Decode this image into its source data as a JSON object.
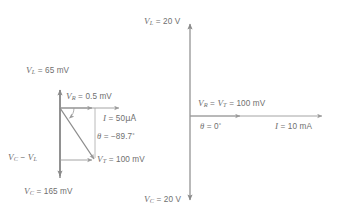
{
  "figure": {
    "type": "phasor-diagram-pair",
    "background_color": "#ffffff",
    "stroke_color": "#8a8a8a",
    "text_color": "#6f6f6f"
  },
  "left_diagram": {
    "name": "series-rlc-phasor-below-resonance",
    "labels": {
      "v_l": {
        "symbol": "V",
        "subscript": "L",
        "eq": "=",
        "value": "65 mV"
      },
      "v_r": {
        "symbol": "V",
        "subscript": "R",
        "eq": "=",
        "value": "0.5 mV"
      },
      "current": {
        "symbol": "I",
        "eq": "=",
        "value": "50",
        "unit": "μA"
      },
      "theta": {
        "symbol": "θ",
        "eq": "=",
        "value": "−89.7",
        "degree": "°"
      },
      "v_c_minus_v_l": {
        "symbol_a": "V",
        "sub_a": "C",
        "minus": "−",
        "symbol_b": "V",
        "sub_b": "L"
      },
      "v_t": {
        "symbol": "V",
        "subscript": "T",
        "eq": "=",
        "value": "100 mV"
      },
      "v_c": {
        "symbol": "V",
        "subscript": "C",
        "eq": "=",
        "value": "165 mV"
      }
    },
    "vectors": [
      {
        "name": "v-l-up",
        "from": [
          60,
          178
        ],
        "to": [
          60,
          88
        ],
        "direction": "up"
      },
      {
        "name": "v-c-down",
        "from": [
          60,
          88
        ],
        "to": [
          60,
          178
        ],
        "direction": "down"
      },
      {
        "name": "v-r-right",
        "from": [
          60,
          108
        ],
        "to": [
          95,
          108
        ],
        "direction": "right"
      },
      {
        "name": "i-right",
        "from": [
          60,
          108
        ],
        "to": [
          122,
          108
        ],
        "direction": "right"
      },
      {
        "name": "v-t-resultant",
        "from": [
          60,
          108
        ],
        "to": [
          95,
          160
        ],
        "direction": "down-right"
      },
      {
        "name": "v-c-minus-v-l",
        "from": [
          60,
          160
        ],
        "to": [
          95,
          160
        ],
        "direction": "right"
      },
      {
        "name": "v-c-minus-v-l-vertical",
        "from": [
          95,
          108
        ],
        "to": [
          95,
          160
        ],
        "direction": "down"
      }
    ],
    "angle_arc": {
      "center": [
        60,
        108
      ],
      "radius": 14,
      "label": "θ"
    }
  },
  "right_diagram": {
    "name": "series-rlc-phasor-at-resonance",
    "labels": {
      "v_l": {
        "symbol": "V",
        "subscript": "L",
        "eq": "=",
        "value": "20 V"
      },
      "v_r_eq_v_t": {
        "symbol_a": "V",
        "sub_a": "R",
        "eq_a": "=",
        "symbol_b": "V",
        "sub_b": "T",
        "eq_b": "=",
        "value": "100 mV"
      },
      "theta": {
        "symbol": "θ",
        "eq": "=",
        "value": "0",
        "degree": "°"
      },
      "current": {
        "symbol": "I",
        "eq": "=",
        "value": "10 mA"
      },
      "v_c": {
        "symbol": "V",
        "subscript": "C",
        "eq": "=",
        "value": "20 V"
      }
    },
    "vectors": [
      {
        "name": "v-l-up",
        "from": [
          190,
          116
        ],
        "to": [
          190,
          22
        ],
        "direction": "up"
      },
      {
        "name": "v-c-down",
        "from": [
          190,
          116
        ],
        "to": [
          190,
          202
        ],
        "direction": "down"
      },
      {
        "name": "v-r-v-t-right",
        "from": [
          190,
          116
        ],
        "to": [
          243,
          116
        ],
        "direction": "right"
      },
      {
        "name": "i-right",
        "from": [
          190,
          116
        ],
        "to": [
          325,
          116
        ],
        "direction": "right"
      }
    ]
  }
}
